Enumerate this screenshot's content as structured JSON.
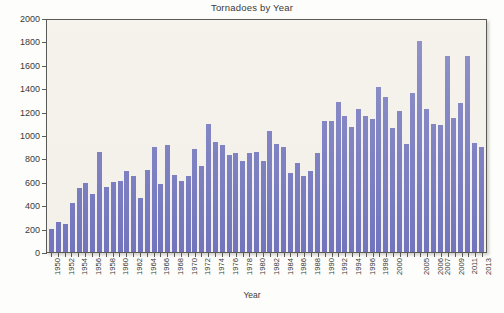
{
  "chart_data": {
    "type": "bar",
    "title": "Tornadoes by Year",
    "xlabel": "Year",
    "ylabel": "",
    "ylim": [
      0,
      2000
    ],
    "ytick_step": 200,
    "yticks": [
      0,
      200,
      400,
      600,
      800,
      1000,
      1200,
      1400,
      1600,
      1800,
      2000
    ],
    "grid": false,
    "legend": null,
    "bar_color": "#5b5fb5",
    "plot_background": "#f2f0e9",
    "categories": [
      "1950",
      "1951",
      "1952",
      "1953",
      "1954",
      "1955",
      "1956",
      "1957",
      "1958",
      "1959",
      "1960",
      "1961",
      "1962",
      "1963",
      "1964",
      "1965",
      "1966",
      "1967",
      "1968",
      "1969",
      "1970",
      "1971",
      "1972",
      "1973",
      "1974",
      "1975",
      "1976",
      "1977",
      "1978",
      "1979",
      "1980",
      "1981",
      "1982",
      "1983",
      "1984",
      "1985",
      "1986",
      "1987",
      "1988",
      "1989",
      "1990",
      "1991",
      "1992",
      "1993",
      "1994",
      "1995",
      "1996",
      "1997",
      "1998",
      "1999",
      "2000",
      "2001",
      "2002",
      "2003",
      "2004",
      "2005",
      "2006",
      "2007",
      "2008",
      "2009",
      "2010",
      "2011",
      "2012",
      "2013"
    ],
    "values": [
      201,
      260,
      240,
      421,
      550,
      593,
      504,
      858,
      564,
      604,
      616,
      697,
      657,
      463,
      704,
      906,
      585,
      926,
      660,
      608,
      653,
      888,
      741,
      1102,
      947,
      920,
      835,
      852,
      788,
      852,
      866,
      783,
      1046,
      931,
      907,
      684,
      764,
      656,
      702,
      856,
      1133,
      1132,
      1297,
      1176,
      1082,
      1235,
      1173,
      1148,
      1424,
      1339,
      1071,
      1215,
      934,
      1374,
      1817,
      1234,
      1103,
      1096,
      1692,
      1156,
      1282,
      1691,
      938,
      903
    ],
    "xtick_labels": [
      "1950",
      "",
      "1952",
      "",
      "1954",
      "",
      "1956",
      "",
      "1958",
      "",
      "1960",
      "",
      "1962",
      "",
      "1964",
      "",
      "1966",
      "",
      "1968",
      "",
      "1970",
      "",
      "1972",
      "",
      "1974",
      "",
      "1976",
      "",
      "1978",
      "",
      "1980",
      "",
      "1982",
      "",
      "1984",
      "",
      "1986",
      "",
      "1988",
      "",
      "1990",
      "",
      "1992",
      "",
      "1994",
      "",
      "1996",
      "",
      "1998",
      "",
      "2000",
      "",
      "",
      "",
      "2005",
      "",
      "2006",
      "2007",
      "",
      "2009",
      "",
      "2011",
      "",
      "2013"
    ]
  }
}
